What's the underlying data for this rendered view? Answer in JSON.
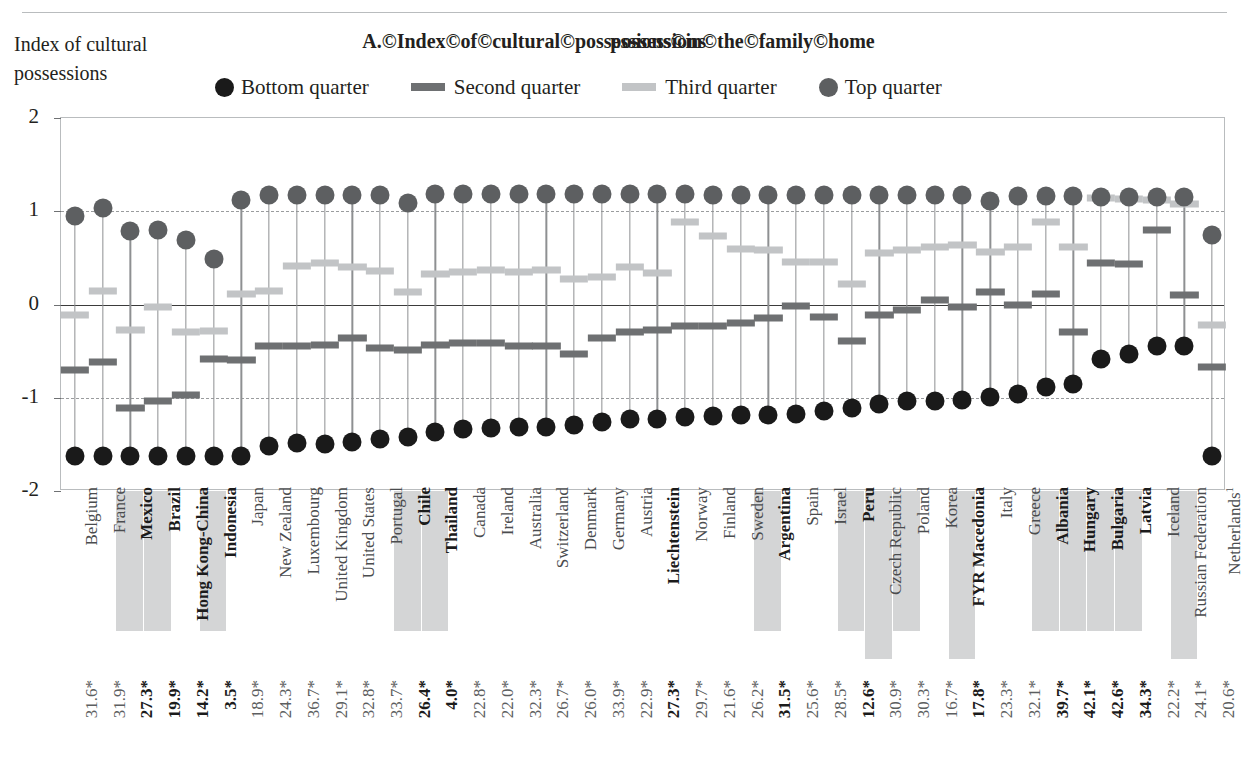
{
  "header": {
    "axis_title": "Index of cultural possessions",
    "chart_title": "A.©Index©of©cultural©possessions©in©the©family©home",
    "title_overlap_artifact": "possessions"
  },
  "legend": {
    "position": "top",
    "items": [
      {
        "label": "Bottom quarter",
        "marker": "circle",
        "color": "#1a1a1a"
      },
      {
        "label": "Second quarter",
        "marker": "dash",
        "color": "#6e7072"
      },
      {
        "label": "Third quarter",
        "marker": "dash",
        "color": "#c2c4c6"
      },
      {
        "label": "Top quarter",
        "marker": "circle",
        "color": "#5d5f61"
      }
    ]
  },
  "colors": {
    "bottom": "#1a1a1a",
    "second": "#6e7072",
    "third": "#c2c4c6",
    "top": "#5d5f61",
    "stem": "#8e9092",
    "grid": "#9a9c9e",
    "zero": "#3b3b3b",
    "highlight_bg": "#d4d5d6",
    "frame": "#b9bcbe"
  },
  "chart_data": {
    "type": "scatter",
    "title": "A.©Index©of©cultural©possessions©in©the©family©home",
    "xlabel": "",
    "ylabel": "Index of cultural possessions",
    "ylim": [
      -2,
      2
    ],
    "yticks": [
      2,
      1,
      0,
      -1,
      -2
    ],
    "grid": "dashed horizontal at 1 and -1; solid zero line",
    "legend_position": "top",
    "series_names": [
      "Bottom quarter",
      "Second quarter",
      "Third quarter",
      "Top quarter"
    ],
    "value_row_label": "percentage (with * significance marker)",
    "categories": [
      "Belgium",
      "France",
      "Mexico",
      "Brazil",
      "Hong Kong-China",
      "Indonesia",
      "Japan",
      "New Zealand",
      "Luxembourg",
      "United Kingdom",
      "United States",
      "Portugal",
      "Chile",
      "Thailand",
      "Canada",
      "Ireland",
      "Australia",
      "Switzerland",
      "Denmark",
      "Germany",
      "Austria",
      "Liechtenstein",
      "Norway",
      "Finland",
      "Sweden",
      "Argentina",
      "Spain",
      "Israel",
      "Peru",
      "Czech Republic",
      "Poland",
      "Korea",
      "FYR Macedonia",
      "Italy",
      "Greece",
      "Albania",
      "Hungary",
      "Bulgaria",
      "Latvia",
      "Iceland",
      "Russian Federation",
      "Netherlands¹"
    ],
    "categories_bold": [
      "Mexico",
      "Brazil",
      "Hong Kong-China",
      "Indonesia",
      "Chile",
      "Thailand",
      "Liechtenstein",
      "Argentina",
      "Peru",
      "FYR Macedonia",
      "Albania",
      "Hungary",
      "Bulgaria",
      "Latvia"
    ],
    "categories_highlighted": [
      "Mexico",
      "Brazil",
      "Indonesia",
      "Chile",
      "Thailand",
      "Argentina",
      "Peru",
      "Czech Republic",
      "Poland",
      "FYR Macedonia",
      "Albania",
      "Hungary",
      "Bulgaria",
      "Latvia",
      "Russian Federation"
    ],
    "value_labels": [
      "31.6*",
      "31.9*",
      "27.3*",
      "19.9*",
      "14.2*",
      "3.5*",
      "18.9*",
      "24.3*",
      "36.7*",
      "29.1*",
      "32.8*",
      "33.7*",
      "26.4*",
      "4.0*",
      "22.8*",
      "22.0*",
      "32.3*",
      "26.7*",
      "26.0*",
      "33.9*",
      "22.9*",
      "27.3*",
      "29.7*",
      "21.6*",
      "26.2*",
      "31.5*",
      "25.6*",
      "28.5*",
      "12.6*",
      "30.9*",
      "30.3*",
      "16.7*",
      "17.8*",
      "23.3*",
      "32.1*",
      "39.7*",
      "42.1*",
      "42.6*",
      "34.3*",
      "22.2*",
      "24.1*",
      "20.6*"
    ],
    "value_labels_bold": [
      "27.3*",
      "19.9*",
      "14.2*",
      "3.5*",
      "26.4*",
      "4.0*",
      "27.3*",
      "31.5*",
      "12.6*",
      "17.8*",
      "39.7*",
      "42.1*",
      "42.6*",
      "34.3*"
    ],
    "series": [
      {
        "name": "Bottom quarter",
        "values": [
          -1.62,
          -1.62,
          -1.63,
          -1.63,
          -1.63,
          -1.62,
          -1.62,
          -1.52,
          -1.48,
          -1.5,
          -1.47,
          -1.44,
          -1.42,
          -1.37,
          -1.34,
          -1.32,
          -1.31,
          -1.31,
          -1.29,
          -1.26,
          -1.23,
          -1.23,
          -1.21,
          -1.2,
          -1.19,
          -1.19,
          -1.17,
          -1.14,
          -1.11,
          -1.07,
          -1.04,
          -1.03,
          -1.02,
          -0.99,
          -0.96,
          -0.89,
          -0.85,
          -0.58,
          -0.53,
          -0.45,
          -0.45,
          -1.63
        ]
      },
      {
        "name": "Second quarter",
        "values": [
          -0.7,
          -0.62,
          -1.11,
          -1.03,
          -0.97,
          -0.58,
          -0.59,
          -0.44,
          -0.45,
          -0.43,
          -0.36,
          -0.47,
          -0.49,
          -0.43,
          -0.41,
          -0.41,
          -0.44,
          -0.45,
          -0.53,
          -0.36,
          -0.29,
          -0.27,
          -0.23,
          -0.23,
          -0.2,
          -0.15,
          -0.02,
          -0.13,
          -0.39,
          -0.11,
          -0.06,
          0.05,
          -0.03,
          0.13,
          -0.01,
          0.11,
          -0.3,
          0.45,
          0.43,
          0.8,
          0.1,
          -0.67
        ]
      },
      {
        "name": "Third quarter",
        "values": [
          -0.11,
          0.15,
          -0.27,
          -0.03,
          -0.29,
          -0.28,
          0.11,
          0.14,
          0.41,
          0.45,
          0.4,
          0.36,
          0.13,
          0.33,
          0.35,
          0.37,
          0.35,
          0.37,
          0.27,
          0.29,
          0.4,
          0.34,
          0.88,
          0.73,
          0.6,
          0.58,
          0.46,
          0.46,
          0.22,
          0.55,
          0.58,
          0.62,
          0.64,
          0.56,
          0.62,
          0.88,
          0.62,
          1.14,
          1.13,
          1.12,
          1.08,
          -0.22
        ]
      },
      {
        "name": "Top quarter",
        "values": [
          0.95,
          1.04,
          0.79,
          0.8,
          0.69,
          0.49,
          1.12,
          1.17,
          1.17,
          1.17,
          1.17,
          1.17,
          1.09,
          1.19,
          1.18,
          1.18,
          1.18,
          1.18,
          1.18,
          1.18,
          1.18,
          1.18,
          1.18,
          1.17,
          1.17,
          1.17,
          1.17,
          1.17,
          1.17,
          1.17,
          1.17,
          1.17,
          1.17,
          1.11,
          1.16,
          1.16,
          1.16,
          1.15,
          1.15,
          1.15,
          1.15,
          0.75
        ]
      }
    ]
  }
}
